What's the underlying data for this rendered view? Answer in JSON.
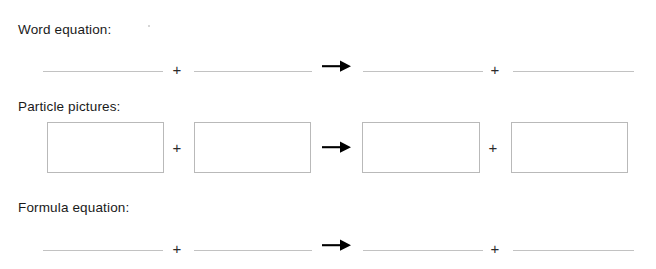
{
  "worksheet": {
    "title": "Chemical equation worksheet template",
    "background_color": "#ffffff",
    "line_color": "#c2c2c2",
    "box_border_color": "#b9b9b9",
    "text_color": "#1a1a1a",
    "arrow_color": "#000000",
    "sections": [
      {
        "id": "word-equation",
        "label": "Word equation:",
        "type": "lines",
        "slots": [
          "",
          "",
          "",
          ""
        ],
        "operators": [
          "+",
          "arrow",
          "+"
        ]
      },
      {
        "id": "particle-pictures",
        "label": "Particle pictures:",
        "type": "boxes",
        "slots": [
          "",
          "",
          "",
          ""
        ],
        "operators": [
          "+",
          "arrow",
          "+"
        ]
      },
      {
        "id": "formula-equation",
        "label": "Formula equation:",
        "type": "lines",
        "slots": [
          "",
          "",
          "",
          ""
        ],
        "operators": [
          "+",
          "arrow",
          "+"
        ]
      }
    ],
    "symbols": {
      "plus": "+",
      "arrow": "→"
    }
  }
}
